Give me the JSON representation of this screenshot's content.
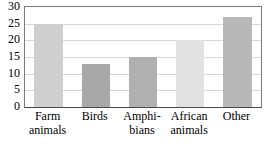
{
  "chart_data": {
    "type": "bar",
    "title": "",
    "subtitle": "",
    "xlabel": "",
    "ylabel": "",
    "categories": [
      "Farm animals",
      "Birds",
      "Amphibians",
      "African animals",
      "Other"
    ],
    "category_labels_wrapped": [
      "Farm\nanimals",
      "Birds",
      "Amphi-\nbians",
      "African\nanimals",
      "Other"
    ],
    "values": [
      25,
      13,
      15,
      20,
      27
    ],
    "bar_colors": [
      "#cfcfcf",
      "#a8a8a8",
      "#b0b0b0",
      "#e2e2e2",
      "#b8b8b8"
    ],
    "ylim": [
      0,
      30
    ],
    "ytick_values": [
      0,
      5,
      10,
      15,
      20,
      25,
      30
    ],
    "ytick_labels": [
      "0",
      "5",
      "10",
      "15",
      "20",
      "25",
      "30"
    ],
    "grid": "horizontal",
    "gridline_color": "#d8d8d8",
    "legend": "none",
    "annotations": []
  }
}
